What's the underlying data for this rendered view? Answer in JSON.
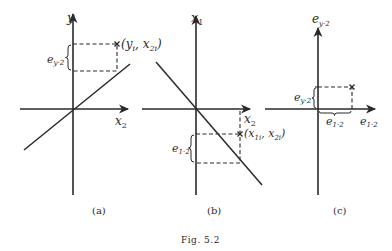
{
  "figure": {
    "caption": "Fig. 5.2",
    "panels": [
      {
        "id": "a",
        "label": "(a)",
        "y_axis_label": "y",
        "x_axis_label": "x",
        "x_axis_sub": "2",
        "point_label_open": "(y",
        "point_label_i": "i",
        "point_label_mid": ", x",
        "point_label_sub": "2i",
        "point_label_close": ")",
        "brace_label": "e",
        "brace_sub": "y·2",
        "regression_slope": "positive"
      },
      {
        "id": "b",
        "label": "(b)",
        "y_axis_label": "x",
        "y_axis_sub": "1",
        "x_axis_label": "x",
        "x_axis_sub": "2",
        "point_label_open": "(x",
        "point_label_i": "1i",
        "point_label_mid": ", x",
        "point_label_sub": "2i",
        "point_label_close": ")",
        "brace_label": "e",
        "brace_sub": "1·2",
        "regression_slope": "negative"
      },
      {
        "id": "c",
        "label": "(c)",
        "y_axis_label": "e",
        "y_axis_sub": "y·2",
        "x_axis_label": "e",
        "x_axis_sub": "1·2",
        "brace_v_label": "e",
        "brace_v_sub": "y·2",
        "brace_h_label": "e",
        "brace_h_sub": "1·2"
      }
    ]
  },
  "colors": {
    "ink": "#2a2a2a",
    "background": "#ffffff"
  }
}
